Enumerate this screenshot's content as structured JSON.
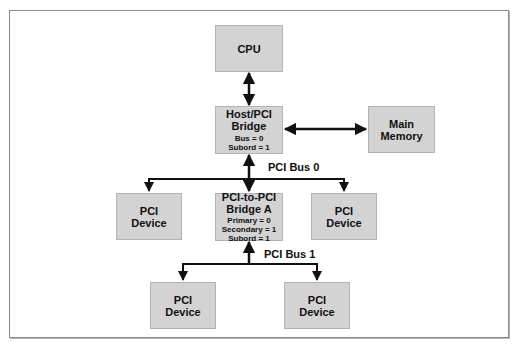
{
  "diagram": {
    "nodes": {
      "cpu": {
        "lines": [
          "CPU"
        ]
      },
      "host_bridge": {
        "title": [
          "Host/PCI",
          "Bridge"
        ],
        "details": [
          "Bus = 0",
          "Subord = 1"
        ]
      },
      "main_memory": {
        "lines": [
          "Main",
          "Memory"
        ]
      },
      "pci_device_left": {
        "lines": [
          "PCI",
          "Device"
        ]
      },
      "pci_bridge_a": {
        "title": [
          "PCI-to-PCI",
          "Bridge A"
        ],
        "details": [
          "Primary = 0",
          "Secondary = 1",
          "Subord = 1"
        ]
      },
      "pci_device_right": {
        "lines": [
          "PCI",
          "Device"
        ]
      },
      "pci_device_bottom_left": {
        "lines": [
          "PCI",
          "Device"
        ]
      },
      "pci_device_bottom_right": {
        "lines": [
          "PCI",
          "Device"
        ]
      }
    },
    "buses": {
      "bus0": "PCI Bus 0",
      "bus1": "PCI Bus 1"
    },
    "colors": {
      "box_fill": "#d3d3d3",
      "box_border": "#b3b3b3",
      "line": "#111111",
      "frame": "#8a8a8a"
    }
  }
}
